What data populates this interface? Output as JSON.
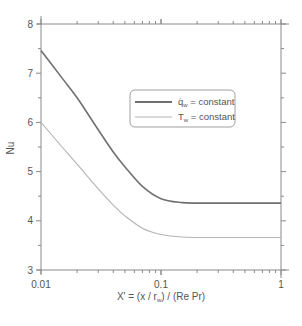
{
  "chart_data": {
    "type": "line",
    "title": "",
    "xlabel": "X' = (x / r_w) / (Re Pr)",
    "ylabel": "Nu",
    "xscale": "log",
    "xlim": [
      0.01,
      1
    ],
    "ylim": [
      3,
      8
    ],
    "x_ticks": [
      "0.01",
      "0.1",
      "1"
    ],
    "y_ticks": [
      "3",
      "4",
      "5",
      "6",
      "7",
      "8"
    ],
    "grid": false,
    "legend_position": "upper right (inside)",
    "x": [
      0.01,
      0.015,
      0.02,
      0.03,
      0.04,
      0.05,
      0.07,
      0.1,
      0.15,
      0.2,
      0.3,
      0.5,
      1.0
    ],
    "series": [
      {
        "name": "q̇_w = constant",
        "color": "#707070",
        "values": [
          7.46,
          6.9,
          6.5,
          5.85,
          5.4,
          5.1,
          4.7,
          4.45,
          4.37,
          4.36,
          4.36,
          4.36,
          4.36
        ]
      },
      {
        "name": "T_w = constant",
        "color": "#b4b4b4",
        "values": [
          6.0,
          5.5,
          5.15,
          4.65,
          4.32,
          4.1,
          3.85,
          3.72,
          3.67,
          3.66,
          3.66,
          3.66,
          3.66
        ]
      }
    ]
  },
  "axes": {
    "xlabel_main": "X' = (x / r",
    "xlabel_sub": "w",
    "xlabel_tail": ") / (Re Pr)",
    "ylabel": "Nu",
    "x_tick_labels": [
      "0.01",
      "0.1",
      "1"
    ],
    "y_tick_labels": [
      "3",
      "4",
      "5",
      "6",
      "7",
      "8"
    ]
  },
  "legend": {
    "items": [
      {
        "symbol": "q̇",
        "sub": "w",
        "text": " = constant",
        "color": "#707070"
      },
      {
        "symbol": "T",
        "sub": "w",
        "text": " = constant",
        "color": "#b4b4b4"
      }
    ]
  }
}
